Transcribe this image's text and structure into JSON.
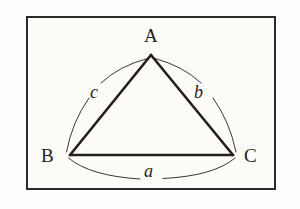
{
  "figure": {
    "name": "triangle-with-labeled-sides",
    "background_color": "#fdfdfb",
    "panel_color": "#fdfcf8",
    "ink_color": "#231f1e",
    "frame": {
      "border_color": "#2b2b2b",
      "border_width_px": 2.2,
      "x": 26,
      "y": 16,
      "width": 250,
      "height": 174
    },
    "triangle": {
      "stroke_color": "#231f1e",
      "stroke_width_px": 2.6,
      "vertices": [
        {
          "name": "A",
          "x": 151,
          "y": 55
        },
        {
          "name": "B",
          "x": 70,
          "y": 155
        },
        {
          "name": "C",
          "x": 233,
          "y": 155
        }
      ]
    },
    "arcs": {
      "stroke_color": "#3a3532",
      "stroke_width_px": 1.0,
      "items": [
        {
          "name": "arc-side-c",
          "from": "A",
          "to": "B",
          "bulge": "outward-left"
        },
        {
          "name": "arc-side-b",
          "from": "A",
          "to": "C",
          "bulge": "outward-right"
        },
        {
          "name": "arc-side-a",
          "from": "B",
          "to": "C",
          "bulge": "outward-down"
        }
      ]
    },
    "vertex_labels": [
      {
        "key": "A",
        "text": "A",
        "style": "upright-serif-capital"
      },
      {
        "key": "B",
        "text": "B",
        "style": "upright-serif-capital"
      },
      {
        "key": "C",
        "text": "C",
        "style": "upright-serif-capital"
      }
    ],
    "side_labels": [
      {
        "key": "a",
        "text": "a",
        "style": "italic-serif-lowercase",
        "opposite_vertex": "A",
        "side": "BC"
      },
      {
        "key": "b",
        "text": "b",
        "style": "italic-serif-lowercase",
        "opposite_vertex": "B",
        "side": "AC"
      },
      {
        "key": "c",
        "text": "c",
        "style": "italic-serif-lowercase",
        "opposite_vertex": "C",
        "side": "AB"
      }
    ]
  }
}
